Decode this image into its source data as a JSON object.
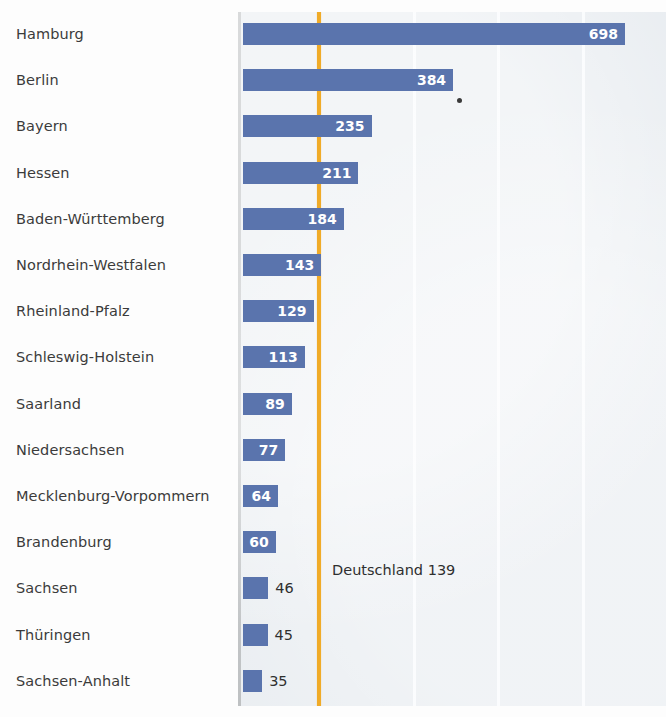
{
  "chart_data": {
    "type": "bar",
    "orientation": "horizontal",
    "title": "",
    "subtitle": "",
    "xlabel": "",
    "ylabel": "",
    "categories": [
      "Hamburg",
      "Berlin",
      "Bayern",
      "Hessen",
      "Baden-Württemberg",
      "Nordrhein-Westfalen",
      "Rheinland-Pfalz",
      "Schleswig-Holstein",
      "Saarland",
      "Niedersachsen",
      "Mecklenburg-Vorpommern",
      "Brandenburg",
      "Sachsen",
      "Thüringen",
      "Sachsen-Anhalt"
    ],
    "values": [
      698,
      384,
      235,
      211,
      184,
      143,
      129,
      113,
      89,
      77,
      64,
      60,
      46,
      45,
      35
    ],
    "value_labels": [
      "698",
      "384",
      "235",
      "211",
      "184",
      "143",
      "129",
      "113",
      "89",
      "77",
      "64",
      "60",
      "46",
      "45",
      "35"
    ],
    "label_placement": [
      "inside",
      "inside",
      "inside",
      "inside",
      "inside",
      "inside",
      "inside",
      "inside",
      "inside",
      "inside",
      "inside",
      "inside",
      "outside",
      "outside",
      "outside"
    ],
    "xlim": [
      0,
      773
    ],
    "grid": true,
    "gridlines_x": [
      310,
      465,
      620
    ],
    "legend": "none",
    "reference_line": {
      "label": "Deutschland 139",
      "value": 139,
      "color": "#f0ab28"
    },
    "colors": {
      "bar": "#5a74ad",
      "plot_background": "#e9edf1",
      "gridline": "#fafcfd",
      "axis": "#b9bcbe",
      "reference": "#f0ab28",
      "label_text": "#3b3b3b",
      "inside_value_text": "#ffffff",
      "outside_value_text": "#2f2f2f"
    }
  }
}
